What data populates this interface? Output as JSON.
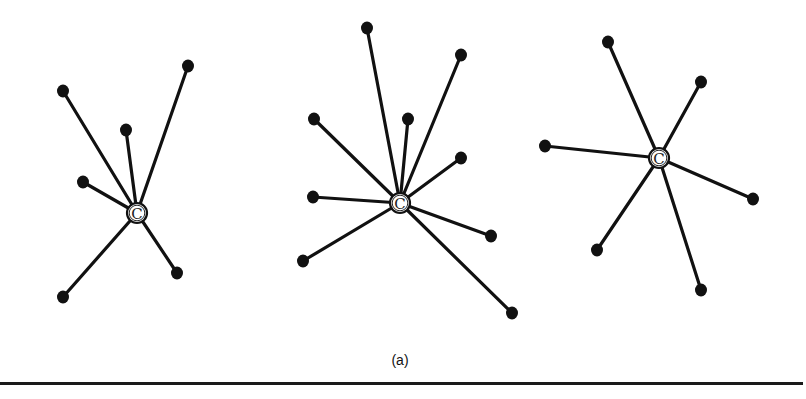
{
  "figure": {
    "caption": "(a)",
    "hub_label": "C",
    "colors": {
      "ink": "#111111",
      "background": "#ffffff"
    },
    "stars": [
      {
        "id": "star-1",
        "center": [
          137,
          213
        ],
        "leaves": [
          [
            63,
            91
          ],
          [
            188,
            66
          ],
          [
            126,
            130
          ],
          [
            83,
            182
          ],
          [
            63,
            297
          ],
          [
            177,
            273
          ]
        ]
      },
      {
        "id": "star-2",
        "center": [
          400,
          203
        ],
        "leaves": [
          [
            367,
            28
          ],
          [
            461,
            55
          ],
          [
            314,
            119
          ],
          [
            408,
            119
          ],
          [
            461,
            158
          ],
          [
            313,
            197
          ],
          [
            303,
            261
          ],
          [
            491,
            236
          ],
          [
            512,
            313
          ]
        ]
      },
      {
        "id": "star-3",
        "center": [
          659,
          158
        ],
        "leaves": [
          [
            608,
            42
          ],
          [
            701,
            82
          ],
          [
            545,
            146
          ],
          [
            753,
            199
          ],
          [
            597,
            250
          ],
          [
            701,
            290
          ]
        ]
      }
    ]
  }
}
